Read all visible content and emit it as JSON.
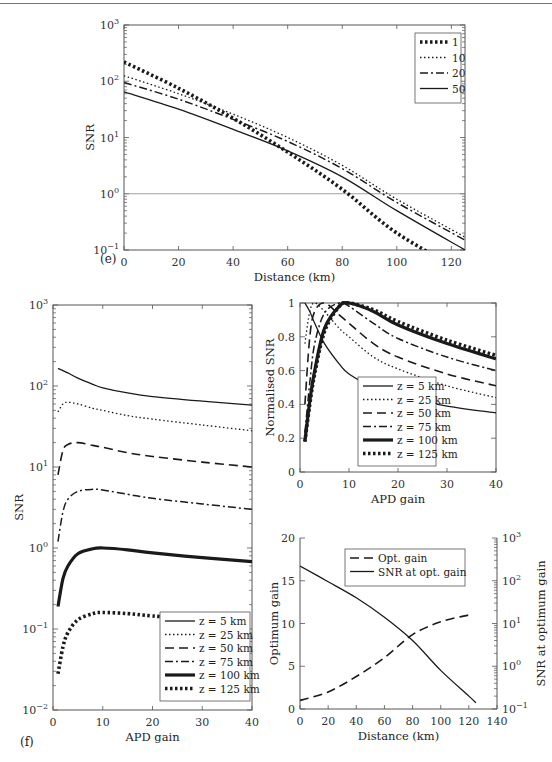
{
  "panels": {
    "e_label": "(e)",
    "f_label": "(f)"
  },
  "chart_data": [
    {
      "id": "e",
      "type": "line",
      "title": "",
      "xlabel": "Distance (km)",
      "ylabel": "SNR",
      "xlim": [
        0,
        125
      ],
      "ylim": [
        0.1,
        1000
      ],
      "yscale": "log",
      "xticks": [
        0,
        20,
        40,
        60,
        80,
        100,
        120
      ],
      "yticks": [
        "10^-1",
        "10^0",
        "10^1",
        "10^2",
        "10^3"
      ],
      "reference_line": {
        "y": 1
      },
      "legend_position": "upper right",
      "x": [
        0,
        20,
        40,
        60,
        80,
        100,
        125
      ],
      "series": [
        {
          "name": "1",
          "style": "heavy-dotted",
          "values": [
            220,
            75,
            22,
            5.5,
            1.2,
            0.2,
            0.04
          ]
        },
        {
          "name": "10",
          "style": "dotted",
          "values": [
            125,
            60,
            26,
            10,
            3.2,
            0.8,
            0.17
          ]
        },
        {
          "name": "20",
          "style": "dash-dot",
          "values": [
            95,
            48,
            21,
            8.5,
            2.8,
            0.7,
            0.15
          ]
        },
        {
          "name": "50",
          "style": "solid",
          "values": [
            65,
            32,
            14,
            5.8,
            2.0,
            0.5,
            0.1
          ]
        }
      ]
    },
    {
      "id": "f-left",
      "type": "line",
      "xlabel": "APD gain",
      "ylabel": "SNR",
      "xlim": [
        0,
        40
      ],
      "ylim": [
        0.01,
        1000
      ],
      "yscale": "log",
      "xticks": [
        0,
        10,
        20,
        30,
        40
      ],
      "yticks": [
        "10^-2",
        "10^-1",
        "10^0",
        "10^1",
        "10^2",
        "10^3"
      ],
      "legend_position": "lower right",
      "x": [
        1,
        2,
        3,
        5,
        8,
        10,
        15,
        20,
        30,
        40
      ],
      "series": [
        {
          "name": "z = 5 km",
          "style": "solid",
          "values": [
            165,
            155,
            145,
            125,
            105,
            95,
            82,
            74,
            65,
            58
          ]
        },
        {
          "name": "z = 25 km",
          "style": "dotted",
          "values": [
            48,
            60,
            63,
            60,
            53,
            50,
            43,
            39,
            33,
            28
          ]
        },
        {
          "name": "z = 50 km",
          "style": "dashed",
          "values": [
            8,
            16,
            19,
            20,
            18.5,
            17.5,
            15,
            13.5,
            11.5,
            10
          ]
        },
        {
          "name": "z = 75 km",
          "style": "dash-dot",
          "values": [
            1.2,
            2.8,
            4.0,
            5.0,
            5.3,
            5.2,
            4.6,
            4.1,
            3.5,
            3.0
          ]
        },
        {
          "name": "z = 100 km",
          "style": "thick-solid",
          "values": [
            0.19,
            0.42,
            0.6,
            0.85,
            0.98,
            1.0,
            0.95,
            0.87,
            0.76,
            0.68
          ]
        },
        {
          "name": "z = 125 km",
          "style": "heavy-dotted",
          "values": [
            0.028,
            0.06,
            0.09,
            0.13,
            0.155,
            0.16,
            0.155,
            0.145,
            0.128,
            0.113
          ]
        }
      ]
    },
    {
      "id": "f-top-right",
      "type": "line",
      "xlabel": "APD gain",
      "ylabel": "Normalised SNR",
      "xlim": [
        0,
        40
      ],
      "ylim": [
        0,
        1
      ],
      "xticks": [
        0,
        10,
        20,
        30,
        40
      ],
      "yticks": [
        0,
        0.2,
        0.4,
        0.6,
        0.8,
        1
      ],
      "legend_position": "lower center",
      "x": [
        1,
        2,
        3,
        5,
        8,
        10,
        15,
        20,
        30,
        40
      ],
      "series": [
        {
          "name": "z = 5 km",
          "style": "solid",
          "values": [
            1.0,
            0.95,
            0.88,
            0.76,
            0.64,
            0.58,
            0.5,
            0.45,
            0.39,
            0.35
          ]
        },
        {
          "name": "z = 25 km",
          "style": "dotted",
          "values": [
            0.76,
            0.95,
            1.0,
            0.95,
            0.85,
            0.8,
            0.68,
            0.61,
            0.51,
            0.44
          ]
        },
        {
          "name": "z = 50 km",
          "style": "dashed",
          "values": [
            0.4,
            0.8,
            0.95,
            1.0,
            0.93,
            0.88,
            0.76,
            0.68,
            0.58,
            0.51
          ]
        },
        {
          "name": "z = 75 km",
          "style": "dash-dot",
          "values": [
            0.23,
            0.53,
            0.76,
            0.94,
            1.0,
            0.98,
            0.88,
            0.79,
            0.68,
            0.6
          ]
        },
        {
          "name": "z = 100 km",
          "style": "thick-solid",
          "values": [
            0.18,
            0.42,
            0.6,
            0.85,
            0.98,
            1.0,
            0.95,
            0.87,
            0.76,
            0.67
          ]
        },
        {
          "name": "z = 125 km",
          "style": "heavy-dotted",
          "values": [
            0.18,
            0.4,
            0.58,
            0.83,
            0.98,
            1.0,
            0.96,
            0.89,
            0.78,
            0.69
          ]
        }
      ]
    },
    {
      "id": "f-bottom-right",
      "type": "line",
      "xlabel": "Distance (km)",
      "ylabel": "Optimum gain",
      "ylabel_right": "SNR at optimum gain",
      "xlim": [
        0,
        140
      ],
      "ylim": [
        0,
        20
      ],
      "ylim_right": [
        0.1,
        1000
      ],
      "yscale_right": "log",
      "xticks": [
        0,
        20,
        40,
        60,
        80,
        100,
        120,
        140
      ],
      "yticks": [
        0,
        5,
        10,
        15,
        20
      ],
      "yticks_right": [
        "10^-1",
        "10^0",
        "10^1",
        "10^2",
        "10^3"
      ],
      "legend_position": "upper center",
      "x": [
        0,
        20,
        40,
        60,
        80,
        100,
        120,
        125
      ],
      "series": [
        {
          "name": "Opt. gain",
          "axis": "left",
          "style": "dashed",
          "values": [
            1.0,
            2.0,
            3.8,
            6.0,
            8.7,
            10.2,
            11.0,
            null
          ]
        },
        {
          "name": "SNR at opt. gain",
          "axis": "right",
          "style": "solid",
          "values": [
            220,
            95,
            40,
            14,
            4.0,
            0.8,
            0.2,
            0.14
          ]
        }
      ]
    }
  ]
}
